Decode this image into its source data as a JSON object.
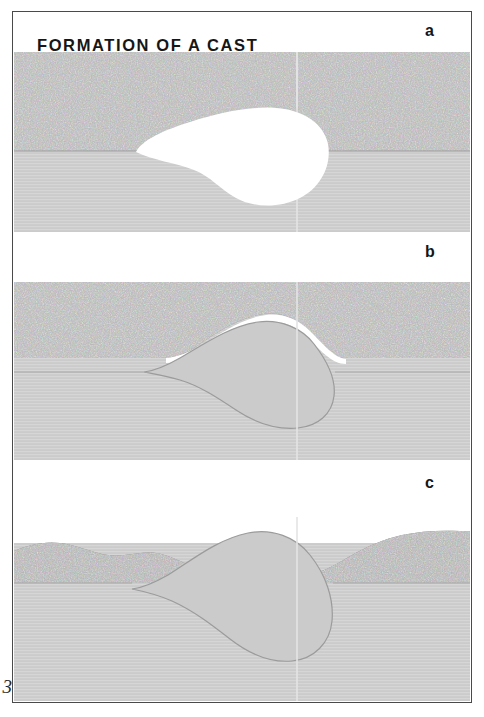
{
  "figure": {
    "title": "FORMATION OF A CAST",
    "page_number": "3",
    "panels": [
      {
        "letter": "a",
        "caption": "open void in sediment"
      },
      {
        "letter": "b",
        "caption": "void filled by sediment"
      },
      {
        "letter": "c",
        "caption": "cast exposed by erosion"
      }
    ]
  },
  "colors": {
    "dark_sediment": "#858585",
    "dark_sediment_speckle_light": "#c8c8c8",
    "dark_sediment_speckle_dark": "#4e4e4e",
    "light_sediment": "#d4d4d4",
    "light_sediment_line": "#c2c2c2",
    "cast_fill": "#cbcbcb",
    "void_white": "#ffffff",
    "outline": "#8c8c8c",
    "frame": "#4a4a4a",
    "text": "#161616",
    "seam": "#e8e8e8",
    "highlight": "#ffffff"
  },
  "geometry": {
    "seam_x_fraction": 0.62,
    "panel_a": {
      "layer_boundary_fraction": 0.55
    },
    "panel_b": {
      "layer_boundary_fraction": 0.46
    },
    "panel_c": {
      "layer_boundary_fraction": 0.36
    }
  }
}
